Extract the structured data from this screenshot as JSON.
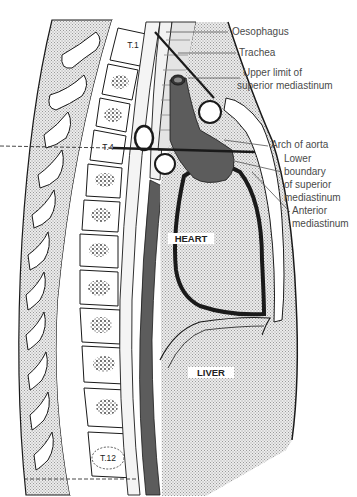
{
  "figure": {
    "colors": {
      "background": "#ffffff",
      "stipple_fill": "#d8d8d8",
      "dark_vessel": "#5c5c5c",
      "outline": "#1a1a1a",
      "label_text": "#4a4a4a",
      "leader_line": "#555555"
    }
  },
  "labels": {
    "oesophagus": "Oesophagus",
    "trachea": "Trachea",
    "upper_limit_line1": "Upper limit of",
    "upper_limit_line2": "superior mediastinum",
    "arch_of_aorta": "Arch of aorta",
    "lower_boundary_line1": "Lower",
    "lower_boundary_line2": "boundary",
    "lower_boundary_line3": "of superior",
    "lower_boundary_line4": "mediastinum",
    "anterior_line1": "Anterior",
    "anterior_line2": "mediastinum"
  },
  "organs": {
    "heart": "HEART",
    "liver": "LIVER"
  },
  "vertebrae": {
    "t1": "T.1",
    "t4": "T.4",
    "t12": "T.12"
  }
}
